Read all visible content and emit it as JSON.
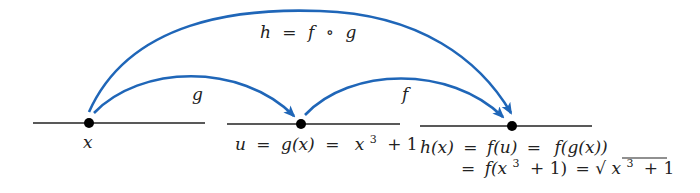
{
  "colors": {
    "arrow": "#1f66b8",
    "line": "#222222",
    "dot": "#000000"
  },
  "labels": {
    "composition": {
      "lhs": "h",
      "eq": "=",
      "f": "f",
      "circ": "∘",
      "g": "g"
    },
    "g_arrow": "g",
    "f_arrow": "f",
    "point_x": "x",
    "point_u": {
      "u": "u",
      "eq1": "=",
      "gx": "g(x)",
      "eq2": "=",
      "x": "x",
      "exp": "3",
      "rest": "+ 1"
    },
    "point_h_line1": {
      "hx": "h(x)",
      "eq1": "=",
      "fu": "f(u)",
      "eq2": "=",
      "fgx": "f(g(x))"
    },
    "point_h_line2": {
      "eq1": "=",
      "fopen": "f(x",
      "exp": "3",
      "plus": "+   1)",
      "eq2": "=",
      "sqrt": "√",
      "x": "x",
      "exp2": "3",
      "rest": "+ 1"
    }
  }
}
